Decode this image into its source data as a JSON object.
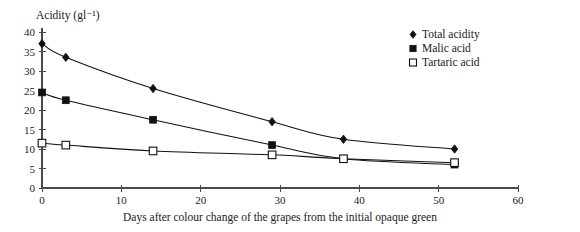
{
  "chart_data": {
    "type": "line",
    "title": "",
    "subtitle": "",
    "xlabel": "Days after colour change of the grapes from the initial opaque green",
    "ylabel": "Acidity (gl⁻¹)",
    "xlim": [
      0,
      60
    ],
    "ylim": [
      0,
      40
    ],
    "xticks": [
      0,
      10,
      20,
      30,
      40,
      50,
      60
    ],
    "yticks": [
      0,
      5,
      10,
      15,
      20,
      25,
      30,
      35,
      40
    ],
    "xtick_labels": [
      "0",
      "10",
      "20",
      "30",
      "40",
      "50",
      "60"
    ],
    "ytick_labels": [
      "0",
      "5",
      "10",
      "15",
      "20",
      "25",
      "30",
      "35",
      "40"
    ],
    "grid": false,
    "legend_position": "top-right",
    "series": [
      {
        "name": "Total acidity",
        "marker": "filled-diamond",
        "x": [
          0,
          3,
          14,
          29,
          38,
          52
        ],
        "values": [
          37,
          33.5,
          25.5,
          17,
          12.5,
          10
        ]
      },
      {
        "name": "Malic acid",
        "marker": "filled-square",
        "x": [
          0,
          3,
          14,
          29,
          38,
          52
        ],
        "values": [
          24.5,
          22.5,
          17.5,
          11,
          7.5,
          6
        ]
      },
      {
        "name": "Tartaric acid",
        "marker": "open-square",
        "x": [
          0,
          3,
          14,
          29,
          38,
          52
        ],
        "values": [
          11.5,
          11,
          9.5,
          8.5,
          7.5,
          6.5
        ]
      }
    ]
  },
  "legend": {
    "items": [
      {
        "label": "Total acidity",
        "marker": "filled-diamond"
      },
      {
        "label": "Malic acid",
        "marker": "filled-square"
      },
      {
        "label": "Tartaric acid",
        "marker": "open-square"
      }
    ]
  },
  "axes": {
    "y_title": "Acidity (gl⁻¹)",
    "x_title": "Days after colour change of the grapes from the initial opaque green"
  },
  "colors": {
    "ink": "#111111",
    "axis": "#4a4a4a",
    "background": "#ffffff"
  }
}
